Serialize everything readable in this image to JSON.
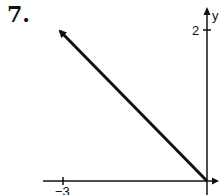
{
  "problem": {
    "number": "7."
  },
  "graph": {
    "y_axis_label": "y",
    "y_tick_label": "2",
    "x_tick_label": "−3",
    "line": {
      "from": {
        "x": 0,
        "y": 0
      },
      "direction": "up-left",
      "arrow_at": "upper-left end",
      "slope": -1
    },
    "colors": {
      "ink": "#111111",
      "background": "#ffffff"
    }
  }
}
